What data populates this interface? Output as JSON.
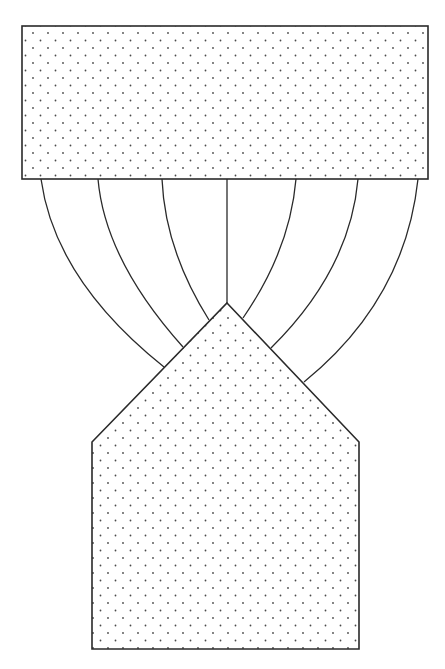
{
  "diagram": {
    "background": "#ffffff",
    "stroke_color": "#2a2a2a",
    "dot_color": "#4a4a4a",
    "fill_pattern": "stippled-dots",
    "top_block": {
      "shape": "rectangle",
      "x": 22,
      "y": 26,
      "width": 406,
      "height": 153
    },
    "bottom_block": {
      "shape": "pentagon",
      "points": [
        [
          227,
          303
        ],
        [
          359,
          442
        ],
        [
          359,
          649
        ],
        [
          92,
          649
        ],
        [
          92,
          442
        ]
      ]
    },
    "connectors": [
      {
        "from": [
          41,
          179
        ],
        "to": [
          164,
          367
        ],
        "ctrl": [
          55,
          280
        ]
      },
      {
        "from": [
          98,
          179
        ],
        "to": [
          183,
          347
        ],
        "ctrl": [
          105,
          260
        ]
      },
      {
        "from": [
          162,
          179
        ],
        "to": [
          209,
          320
        ],
        "ctrl": [
          165,
          250
        ]
      },
      {
        "from": [
          227,
          179
        ],
        "to": [
          227,
          303
        ],
        "ctrl": [
          227,
          240
        ]
      },
      {
        "from": [
          296,
          179
        ],
        "to": [
          243,
          318
        ],
        "ctrl": [
          290,
          250
        ]
      },
      {
        "from": [
          358,
          179
        ],
        "to": [
          271,
          348
        ],
        "ctrl": [
          350,
          270
        ]
      },
      {
        "from": [
          418,
          179
        ],
        "to": [
          304,
          382
        ],
        "ctrl": [
          405,
          300
        ]
      }
    ]
  }
}
